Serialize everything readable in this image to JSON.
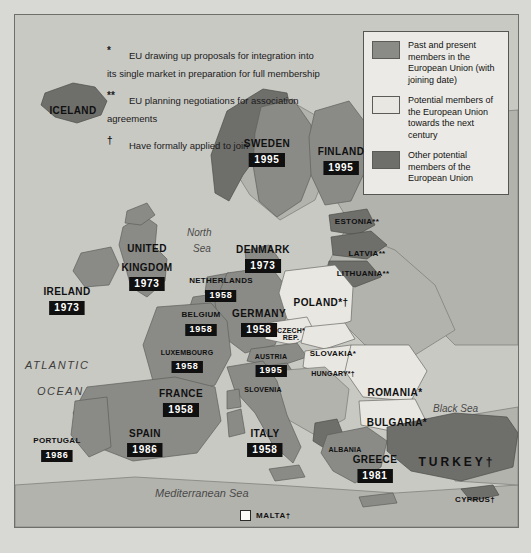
{
  "colors": {
    "member": "#8a8a86",
    "potential_next_century": "#e8e7e2",
    "other_potential": "#6e6e6b",
    "sea": "#c9c9c4",
    "non_eu_land": "#b3b3ae",
    "frame": "#6e6e6a",
    "date_box_bg": "#101010",
    "date_box_text": "#ffffff"
  },
  "notes": [
    {
      "marker": "*",
      "text": "EU drawing up proposals for integration into its single market in preparation for full membership"
    },
    {
      "marker": "**",
      "text": "EU planning negotiations for association agreements"
    },
    {
      "marker": "†",
      "text": "Have formally applied to join"
    }
  ],
  "legend": {
    "items": [
      {
        "swatch": "member",
        "color": "#8a8a86",
        "text": "Past and present members in the European Union (with joining date)"
      },
      {
        "swatch": "potential_next_century",
        "color": "#e8e7e2",
        "text": "Potential members of the European Union towards the next century"
      },
      {
        "swatch": "other_potential",
        "color": "#6e6e6b",
        "text": "Other potential members of the European Union"
      }
    ]
  },
  "members": [
    {
      "name": "SWEDEN",
      "date": "1995"
    },
    {
      "name": "FINLAND",
      "date": "1995"
    },
    {
      "name": "UNITED",
      "date": ""
    },
    {
      "name": "KINGDOM",
      "date": "1973"
    },
    {
      "name": "IRELAND",
      "date": "1973"
    },
    {
      "name": "DENMARK",
      "date": "1973"
    },
    {
      "name": "NETHERLANDS",
      "date": "1958"
    },
    {
      "name": "BELGIUM",
      "date": "1958"
    },
    {
      "name": "LUXEMBOURG",
      "date": "1958"
    },
    {
      "name": "GERMANY",
      "date": "1958"
    },
    {
      "name": "AUSTRIA",
      "date": "1995"
    },
    {
      "name": "FRANCE",
      "date": "1958"
    },
    {
      "name": "SPAIN",
      "date": "1986"
    },
    {
      "name": "PORTUGAL",
      "date": "1986"
    },
    {
      "name": "ITALY",
      "date": "1958"
    },
    {
      "name": "GREECE",
      "date": "1981"
    }
  ],
  "map_labels": {
    "iceland": "ICELAND",
    "sweden": "SWEDEN",
    "sweden_date": "1995",
    "finland": "FINLAND",
    "finland_date": "1995",
    "estonia": "ESTONIA**",
    "latvia": "LATVIA**",
    "lithuania": "LITHUANIA**",
    "united": "UNITED",
    "kingdom": "KINGDOM",
    "kingdom_date": "1973",
    "ireland": "IRELAND",
    "ireland_date": "1973",
    "denmark": "DENMARK",
    "denmark_date": "1973",
    "netherlands": "NETHERLANDS",
    "netherlands_date": "1958",
    "belgium": "BELGIUM",
    "belgium_date": "1958",
    "luxembourg": "LUXEMBOURG",
    "luxembourg_date": "1958",
    "germany": "GERMANY",
    "germany_date": "1958",
    "poland": "POLAND*†",
    "czech": "CZECH*",
    "czech2": "REP.",
    "slovakia": "SLOVAKIA*",
    "austria": "AUSTRIA",
    "austria_date": "1995",
    "hungary": "HUNGARY*†",
    "slovenia": "SLOVENIA",
    "romania": "ROMANIA*",
    "bulgaria": "BULGARIA*",
    "albania": "ALBANIA",
    "greece": "GREECE",
    "greece_date": "1981",
    "turkey": "TURKEY†",
    "cyprus": "CYPRUS†",
    "france": "FRANCE",
    "france_date": "1958",
    "spain": "SPAIN",
    "spain_date": "1986",
    "portugal": "PORTUGAL",
    "portugal_date": "1986",
    "italy": "ITALY",
    "italy_date": "1958",
    "malta": "MALTA†"
  },
  "water_labels": {
    "north_sea_1": "North",
    "north_sea_2": "Sea",
    "atlantic_1": "ATLANTIC",
    "atlantic_2": "OCEAN",
    "mediterranean": "Mediterranean Sea",
    "black_sea": "Black  Sea"
  }
}
